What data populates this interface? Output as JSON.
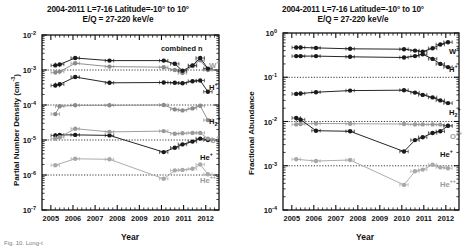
{
  "figure": {
    "caption_partial": "Fig. 10.  Long-t"
  },
  "panels": [
    {
      "id": "left",
      "title_line1": "2004-2011  L=7-16  Latitude=-10° to 10°",
      "title_line2": "E/Q = 27-220 keV/e",
      "ylabel": "Partial Number Density (cm",
      "ylabel_sup": "-3",
      "ylabel_tail": ")",
      "xlabel": "Year",
      "annotation": "combined n",
      "yticks": [
        "-2",
        "-3",
        "-4",
        "-5",
        "-6",
        "-7"
      ],
      "ytick_base": "10",
      "xticks": [
        "2005",
        "2006",
        "2007",
        "2008",
        "2009",
        "2010",
        "2011",
        "2012"
      ],
      "ylim": [
        1e-07,
        0.01
      ],
      "xlim": [
        2004.6,
        2012.6
      ],
      "gridlines": [
        0.001,
        0.0001,
        1e-05,
        1e-06
      ],
      "species_labels": [
        {
          "name": "W",
          "charge": "+",
          "sub": "",
          "faint": true
        },
        {
          "name": "H",
          "charge": "+",
          "sub": "",
          "faint": false
        },
        {
          "name": "H",
          "charge": "+",
          "sub": "2",
          "faint": false
        },
        {
          "name": "O",
          "charge": "+",
          "sub": "",
          "faint": true
        },
        {
          "name": "He",
          "charge": "+",
          "sub": "",
          "faint": false
        },
        {
          "name": "He",
          "charge": "++",
          "sub": "",
          "faint": true
        }
      ]
    },
    {
      "id": "right",
      "title_line1": "2004-2011  L=7-16  Latitude=-10° to 10°",
      "title_line2": "E/Q = 27-220 keV/e",
      "ylabel": "Fractional Abundance",
      "ylabel_sup": "",
      "ylabel_tail": "",
      "xlabel": "Year",
      "annotation": "",
      "yticks": [
        "0",
        "-1",
        "-2",
        "-3",
        "-4"
      ],
      "ytick_base": "10",
      "xticks": [
        "2005",
        "2006",
        "2007",
        "2008",
        "2009",
        "2010",
        "2011",
        "2012"
      ],
      "ylim": [
        0.0001,
        1.0
      ],
      "xlim": [
        2004.6,
        2012.6
      ],
      "gridlines": [
        0.1,
        0.01,
        0.001
      ],
      "species_labels": [
        {
          "name": "W",
          "charge": "+",
          "sub": "",
          "faint": false
        },
        {
          "name": "H",
          "charge": "+",
          "sub": "",
          "faint": false
        },
        {
          "name": "H",
          "charge": "+",
          "sub": "2",
          "faint": false
        },
        {
          "name": "O",
          "charge": "++",
          "sub": "",
          "faint": true
        },
        {
          "name": "He",
          "charge": "+",
          "sub": "",
          "faint": false
        },
        {
          "name": "He",
          "charge": "++",
          "sub": "",
          "faint": true
        }
      ]
    }
  ],
  "chart_data": [
    {
      "type": "line",
      "panel": "left",
      "title": "2004-2011  L=7-16  Latitude=-10° to 10° / E/Q = 27-220 keV/e",
      "xlabel": "Year",
      "ylabel": "Partial Number Density (cm^-3)",
      "xlim": [
        2004.6,
        2012.6
      ],
      "ylim": [
        1e-07,
        0.01
      ],
      "yscale": "log",
      "grid": true,
      "annotation": "combined n",
      "series": [
        {
          "name": "W+",
          "color": "#8a8a8a",
          "x": [
            2005.2,
            2005.4,
            2006.1,
            2007.65,
            2010.1,
            2010.6,
            2010.95,
            2011.4,
            2011.75,
            2012.1
          ],
          "y": [
            0.00085,
            0.0009,
            0.00155,
            0.00125,
            0.0012,
            0.001,
            0.00082,
            0.0013,
            0.0019,
            0.001
          ]
        },
        {
          "name": "H+",
          "color": "#1a1a1a",
          "x": [
            2005.2,
            2005.4,
            2006.1,
            2007.65,
            2010.1,
            2010.6,
            2010.95,
            2011.4,
            2011.75,
            2012.1
          ],
          "y": [
            0.00135,
            0.00145,
            0.0022,
            0.00185,
            0.00185,
            0.0015,
            0.00095,
            0.00135,
            0.0022,
            0.0011
          ]
        },
        {
          "name": "H2+",
          "color": "#1a1a1a",
          "x": [
            2005.2,
            2005.4,
            2006.1,
            2007.65,
            2010.1,
            2010.6,
            2010.95,
            2011.4,
            2011.75,
            2012.1
          ],
          "y": [
            0.00036,
            0.00039,
            0.00063,
            0.00043,
            0.00044,
            0.00043,
            0.00042,
            0.00048,
            0.0005,
            0.00024
          ]
        },
        {
          "name": "O+_upper",
          "color": "#8a8a8a",
          "x": [
            2005.2,
            2005.4,
            2006.1,
            2007.65,
            2010.1,
            2010.6,
            2010.95,
            2011.4,
            2011.75,
            2012.1
          ],
          "y": [
            5.5e-05,
            9.2e-05,
            9.8e-05,
            9.8e-05,
            0.0001,
            7.5e-05,
            7e-05,
            8e-05,
            9.5e-05,
            3.7e-05
          ]
        },
        {
          "name": "He+",
          "color": "#1a1a1a",
          "x": [
            2005.2,
            2005.4,
            2006.1,
            2007.65,
            2010.1,
            2010.6,
            2010.95,
            2011.4,
            2011.75,
            2012.1
          ],
          "y": [
            1.35e-05,
            1.4e-05,
            1.4e-05,
            1.35e-05,
            4.5e-06,
            6e-06,
            7.5e-06,
            9e-06,
            1.1e-05,
            1e-05
          ]
        },
        {
          "name": "O+",
          "color": "#9a9a9a",
          "x": [
            2005.2,
            2005.4,
            2006.1,
            2007.65,
            2010.1,
            2010.6,
            2010.95,
            2011.4,
            2011.75,
            2012.1
          ],
          "y": [
            1.1e-05,
            1.2e-05,
            2.1e-05,
            1.7e-05,
            1.8e-05,
            1.5e-05,
            1.55e-05,
            1.6e-05,
            1.6e-05,
            1.1e-05
          ]
        },
        {
          "name": "He++",
          "color": "#a8a8a8",
          "x": [
            2005.2,
            2006.1,
            2007.65,
            2010.1,
            2010.6,
            2010.95,
            2011.4,
            2011.75,
            2012.1
          ],
          "y": [
            1.9e-06,
            2.9e-06,
            2.8e-06,
            7.8e-07,
            1.35e-06,
            1.4e-06,
            1.5e-06,
            2e-06,
            1.05e-06
          ]
        }
      ]
    },
    {
      "type": "line",
      "panel": "right",
      "title": "2004-2011  L=7-16  Latitude=-10° to 10° / E/Q = 27-220 keV/e",
      "xlabel": "Year",
      "ylabel": "Fractional Abundance",
      "xlim": [
        2004.6,
        2012.6
      ],
      "ylim": [
        0.0001,
        1.0
      ],
      "yscale": "log",
      "grid": true,
      "annotation": "",
      "series": [
        {
          "name": "W+",
          "color": "#1a1a1a",
          "x": [
            2005.2,
            2005.4,
            2006.1,
            2007.65,
            2010.1,
            2010.6,
            2010.95,
            2011.4,
            2011.75,
            2012.1
          ],
          "y": [
            0.47,
            0.47,
            0.46,
            0.44,
            0.43,
            0.4,
            0.38,
            0.45,
            0.55,
            0.62
          ]
        },
        {
          "name": "H+",
          "color": "#1a1a1a",
          "x": [
            2005.2,
            2005.4,
            2006.1,
            2007.65,
            2010.1,
            2010.6,
            2010.95,
            2011.4,
            2011.75,
            2012.1
          ],
          "y": [
            0.3,
            0.3,
            0.3,
            0.29,
            0.28,
            0.3,
            0.33,
            0.26,
            0.2,
            0.17
          ]
        },
        {
          "name": "H2+",
          "color": "#1a1a1a",
          "x": [
            2005.2,
            2005.4,
            2006.1,
            2007.65,
            2010.1,
            2010.6,
            2010.95,
            2011.4,
            2011.75,
            2012.1
          ],
          "y": [
            0.042,
            0.043,
            0.046,
            0.05,
            0.051,
            0.045,
            0.04,
            0.035,
            0.03,
            0.026
          ]
        },
        {
          "name": "O++",
          "color": "#9a9a9a",
          "x": [
            2005.2,
            2005.4,
            2006.1,
            2007.65,
            2010.1,
            2010.6,
            2010.95,
            2011.4,
            2011.75,
            2012.1
          ],
          "y": [
            0.0086,
            0.0088,
            0.009,
            0.0089,
            0.0088,
            0.0086,
            0.0086,
            0.0086,
            0.0085,
            0.008
          ]
        },
        {
          "name": "He+",
          "color": "#1a1a1a",
          "x": [
            2005.2,
            2005.4,
            2006.1,
            2007.65,
            2010.1,
            2010.6,
            2010.95,
            2011.4,
            2011.75,
            2012.1
          ],
          "y": [
            0.012,
            0.011,
            0.0062,
            0.006,
            0.0021,
            0.0038,
            0.0044,
            0.0055,
            0.006,
            0.008
          ]
        },
        {
          "name": "He++",
          "color": "#a8a8a8",
          "x": [
            2005.2,
            2006.1,
            2007.65,
            2010.1,
            2010.6,
            2010.95,
            2011.4,
            2011.75,
            2012.1
          ],
          "y": [
            0.0014,
            0.00128,
            0.00135,
            0.00037,
            0.00075,
            0.00082,
            0.00105,
            0.00092,
            0.00088
          ]
        }
      ]
    }
  ]
}
